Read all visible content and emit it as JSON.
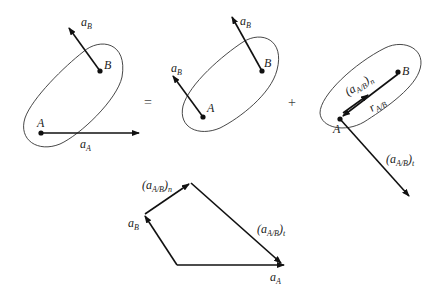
{
  "diagram": {
    "type": "relative-acceleration-vector-diagram",
    "operators": {
      "equals": "=",
      "plus": "+"
    },
    "panel_1": {
      "points": {
        "A": "A",
        "B": "B"
      },
      "vectors": {
        "a_B": {
          "base": "a",
          "sub": "B"
        },
        "a_A": {
          "base": "a",
          "sub": "A"
        }
      }
    },
    "panel_2": {
      "points": {
        "A": "A",
        "B": "B"
      },
      "vectors": {
        "a_B_at_A": {
          "base": "a",
          "sub": "B"
        },
        "a_B_at_B": {
          "base": "a",
          "sub": "B"
        }
      }
    },
    "panel_3": {
      "points": {
        "A": "A",
        "B": "B"
      },
      "vectors": {
        "normal": {
          "open": "(",
          "base": "a",
          "sub": "A/B",
          "close": ")",
          "post": "n"
        },
        "r": {
          "base": "r",
          "sub": "A/B"
        },
        "tangential": {
          "open": "(",
          "base": "a",
          "sub": "A/B",
          "close": ")",
          "post": "t"
        }
      }
    },
    "polygon": {
      "vectors": {
        "normal": {
          "open": "(",
          "base": "a",
          "sub": "A/B",
          "close": ")",
          "post": "n"
        },
        "a_B": {
          "base": "a",
          "sub": "B"
        },
        "tangential": {
          "open": "(",
          "base": "a",
          "sub": "A/B",
          "close": ")",
          "post": "t"
        },
        "a_A": {
          "base": "a",
          "sub": "A"
        }
      }
    },
    "colors": {
      "stroke": "#111111",
      "outline": "#333333",
      "background": "#ffffff"
    }
  }
}
